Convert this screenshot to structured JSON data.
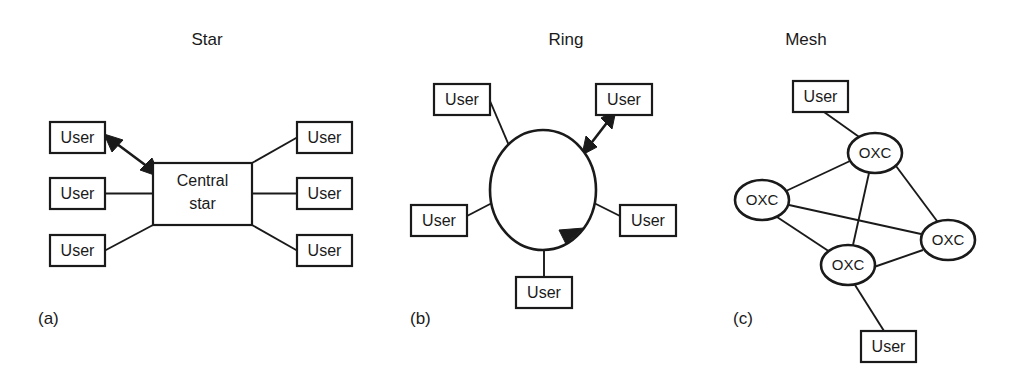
{
  "figure": {
    "caption_labels": [
      "(a)",
      "(b)",
      "(c)"
    ],
    "background_color": "#ffffff",
    "line_color": "#1a1a1a"
  },
  "panels": [
    {
      "id": "star",
      "title": "Star",
      "label": "(a)",
      "title_x": 207,
      "title_y": 41,
      "label_x": 38,
      "label_y": 320,
      "hub": {
        "text_line1": "Central",
        "text_line2": "star",
        "x": 153,
        "y": 163,
        "w": 99,
        "h": 62
      },
      "nodes": [
        {
          "label": "User",
          "x": 50,
          "y": 122,
          "w": 55,
          "h": 31,
          "side": "left",
          "row": "top"
        },
        {
          "label": "User",
          "x": 50,
          "y": 178,
          "w": 55,
          "h": 31,
          "side": "left",
          "row": "middle"
        },
        {
          "label": "User",
          "x": 50,
          "y": 235,
          "w": 55,
          "h": 31,
          "side": "left",
          "row": "bottom"
        },
        {
          "label": "User",
          "x": 297,
          "y": 122,
          "w": 55,
          "h": 31,
          "side": "right",
          "row": "top"
        },
        {
          "label": "User",
          "x": 297,
          "y": 178,
          "w": 55,
          "h": 31,
          "side": "right",
          "row": "middle"
        },
        {
          "label": "User",
          "x": 297,
          "y": 235,
          "w": 55,
          "h": 31,
          "side": "right",
          "row": "bottom"
        }
      ],
      "links": [
        {
          "from": "user-left-top",
          "to": "hub",
          "style": "double-arrow"
        },
        {
          "from": "user-left-middle",
          "to": "hub",
          "style": "plain"
        },
        {
          "from": "user-left-bottom",
          "to": "hub",
          "style": "plain"
        },
        {
          "from": "user-right-top",
          "to": "hub",
          "style": "plain"
        },
        {
          "from": "user-right-middle",
          "to": "hub",
          "style": "plain"
        },
        {
          "from": "user-right-bottom",
          "to": "hub",
          "style": "plain"
        }
      ]
    },
    {
      "id": "ring",
      "title": "Ring",
      "label": "(b)",
      "title_x": 566,
      "title_y": 41,
      "label_x": 410,
      "label_y": 320,
      "ring": {
        "cx": 543,
        "cy": 190,
        "rx": 53,
        "ry": 60,
        "direction_arrow": "clockwise"
      },
      "nodes": [
        {
          "label": "User",
          "x": 434,
          "y": 84,
          "w": 56,
          "h": 31,
          "position": "top-left"
        },
        {
          "label": "User",
          "x": 596,
          "y": 84,
          "w": 56,
          "h": 31,
          "position": "top-right"
        },
        {
          "label": "User",
          "x": 411,
          "y": 205,
          "w": 56,
          "h": 31,
          "position": "left"
        },
        {
          "label": "User",
          "x": 620,
          "y": 205,
          "w": 56,
          "h": 31,
          "position": "right"
        },
        {
          "label": "User",
          "x": 516,
          "y": 277,
          "w": 56,
          "h": 31,
          "position": "bottom"
        }
      ],
      "links": [
        {
          "from": "user-top-left",
          "to": "ring",
          "style": "plain"
        },
        {
          "from": "user-top-right",
          "to": "ring",
          "style": "double-arrow"
        },
        {
          "from": "user-left",
          "to": "ring",
          "style": "plain"
        },
        {
          "from": "user-right",
          "to": "ring",
          "style": "plain"
        },
        {
          "from": "user-bottom",
          "to": "ring",
          "style": "plain"
        }
      ]
    },
    {
      "id": "mesh",
      "title": "Mesh",
      "label": "(c)",
      "title_x": 806,
      "title_y": 41,
      "label_x": 733,
      "label_y": 320,
      "nodes": [
        {
          "label": "User",
          "type": "box",
          "x": 793,
          "y": 81,
          "w": 55,
          "h": 31,
          "position": "top"
        },
        {
          "label": "User",
          "type": "box",
          "x": 861,
          "y": 331,
          "w": 55,
          "h": 31,
          "position": "bottom"
        },
        {
          "label": "OXC",
          "type": "ellipse",
          "cx": 875,
          "cy": 153,
          "rx": 27,
          "ry": 20,
          "position": "top"
        },
        {
          "label": "OXC",
          "type": "ellipse",
          "cx": 762,
          "cy": 200,
          "rx": 27,
          "ry": 20,
          "position": "left"
        },
        {
          "label": "OXC",
          "type": "ellipse",
          "cx": 948,
          "cy": 240,
          "rx": 27,
          "ry": 20,
          "position": "right"
        },
        {
          "label": "OXC",
          "type": "ellipse",
          "cx": 848,
          "cy": 265,
          "rx": 27,
          "ry": 20,
          "position": "bottom"
        }
      ],
      "links": [
        {
          "from": "user-top",
          "to": "oxc-top",
          "style": "plain"
        },
        {
          "from": "oxc-top",
          "to": "oxc-left",
          "style": "plain"
        },
        {
          "from": "oxc-top",
          "to": "oxc-right",
          "style": "plain"
        },
        {
          "from": "oxc-top",
          "to": "oxc-bottom",
          "style": "plain"
        },
        {
          "from": "oxc-left",
          "to": "oxc-right",
          "style": "plain"
        },
        {
          "from": "oxc-left",
          "to": "oxc-bottom",
          "style": "plain"
        },
        {
          "from": "oxc-bottom",
          "to": "oxc-right",
          "style": "plain"
        },
        {
          "from": "oxc-bottom",
          "to": "user-bottom",
          "style": "plain"
        }
      ]
    }
  ]
}
